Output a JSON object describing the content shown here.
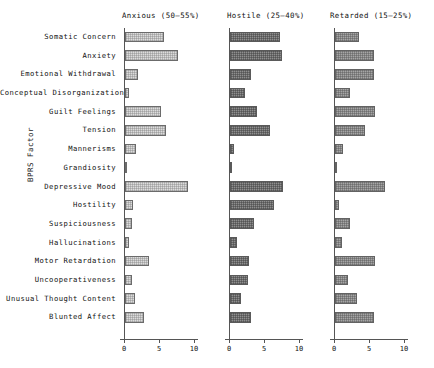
{
  "chart_data": {
    "type": "bar",
    "title": "",
    "ylabel": "BPRS Factor",
    "xlabel": "",
    "xlim": [
      0,
      10
    ],
    "xticks": [
      0,
      5,
      10
    ],
    "xticklabels": [
      "0",
      "5",
      "10"
    ],
    "grid": false,
    "legend": "none",
    "orientation": "horizontal",
    "categories": [
      "Somatic  Concern",
      "Anxiety",
      "Emotional  Withdrawal",
      "Conceptual  Disorganization",
      "Guilt  Feelings",
      "Tension",
      "Mannerisms",
      "Grandiosity",
      "Depressive  Mood",
      "Hostility",
      "Suspiciousness",
      "Hallucinations",
      "Motor  Retardation",
      "Uncooperativeness",
      "Unusual  Thought  Content",
      "Blunted  Affect"
    ],
    "series": [
      {
        "name": "Anxious",
        "panel_title": "Anxious (50—55%)",
        "percent_range": "50—55%",
        "color": "#dcdcdc",
        "values": [
          5.5,
          7.6,
          1.9,
          0.6,
          5.1,
          5.9,
          1.5,
          0.2,
          9.0,
          1.1,
          1.0,
          0.6,
          3.4,
          1.0,
          1.4,
          2.7
        ]
      },
      {
        "name": "Hostile",
        "panel_title": "Hostile  (25—40%)",
        "percent_range": "25—40%",
        "color": "#8f8f8f",
        "values": [
          7.2,
          7.4,
          3.0,
          2.2,
          3.8,
          5.7,
          0.5,
          0.2,
          7.6,
          6.3,
          3.4,
          1.0,
          2.7,
          2.5,
          1.6,
          3.0
        ]
      },
      {
        "name": "Retarded",
        "panel_title": "Retarded (15—25%)",
        "percent_range": "15—25%",
        "color": "#a6a6a6",
        "values": [
          3.4,
          5.5,
          5.6,
          2.2,
          5.7,
          4.3,
          1.1,
          0.2,
          7.2,
          0.5,
          2.1,
          1.0,
          5.7,
          1.8,
          3.1,
          5.6
        ]
      }
    ]
  }
}
